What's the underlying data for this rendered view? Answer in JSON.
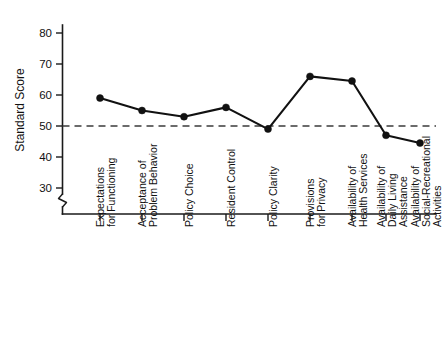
{
  "chart_data": {
    "type": "line",
    "title": "",
    "xlabel": "",
    "ylabel": "Standard Score",
    "ylim": [
      25,
      84
    ],
    "yticks": [
      30,
      40,
      50,
      60,
      70,
      80
    ],
    "ytick_labels": [
      "30",
      "40",
      "50",
      "60",
      "70",
      "80"
    ],
    "grid": false,
    "legend": "none",
    "axis_break": true,
    "reference_line": {
      "value": 50,
      "style": "dashed",
      "color": "#3b3b3b"
    },
    "marker": "filled-circle",
    "line_color": "#111111",
    "categories": [
      "Expectations\nfor Functioning",
      "Acceptance of\nProblem Behavior",
      "Policy Choice",
      "Resident Control",
      "Policy Clarity",
      "Provisions\nfor Privacy",
      "Availability of\nHealth Services",
      "Availability of\nDaily Living\nAssistance",
      "Availability of\nSocial-Recreational\nActivities"
    ],
    "values": [
      59,
      55,
      53,
      56,
      49,
      66,
      64.5,
      47,
      44.5
    ]
  },
  "axis": {
    "y_title": "Standard Score",
    "y_tick_0": "30",
    "y_tick_1": "40",
    "y_tick_2": "50",
    "y_tick_3": "60",
    "y_tick_4": "70",
    "y_tick_5": "80"
  },
  "categories": {
    "c0_l0": "Expectations",
    "c0_l1": "for Functioning",
    "c1_l0": "Acceptance of",
    "c1_l1": "Problem Behavior",
    "c2_l0": "Policy Choice",
    "c3_l0": "Resident Control",
    "c4_l0": "Policy Clarity",
    "c5_l0": "Provisions",
    "c5_l1": "for Privacy",
    "c6_l0": "Availability of",
    "c6_l1": "Health Services",
    "c7_l0": "Availability of",
    "c7_l1": "Daily Living",
    "c7_l2": "Assistance",
    "c8_l0": "Availability of",
    "c8_l1": "Social-Recreational",
    "c8_l2": "Activities"
  }
}
